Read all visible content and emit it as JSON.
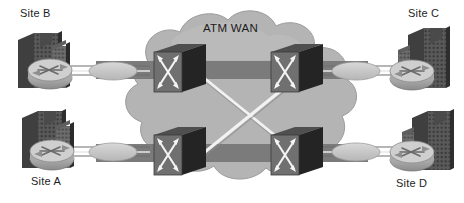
{
  "diagram": {
    "title": "ATM WAN",
    "type": "network-topology",
    "canvas": {
      "width": 464,
      "height": 203
    },
    "background_color": "#ffffff"
  },
  "cloud": {
    "label": "ATM WAN",
    "fill_color": "#b4b4b4",
    "edge_color": "#9a9a9a",
    "band_color": "#7b7b7b"
  },
  "sites": [
    {
      "id": "site-b",
      "label": "Site B",
      "position": "top-left",
      "device": "router",
      "building": "office-building"
    },
    {
      "id": "site-c",
      "label": "Site C",
      "position": "top-right",
      "device": "router",
      "building": "office-building"
    },
    {
      "id": "site-a",
      "label": "Site A",
      "position": "bottom-left",
      "device": "router",
      "building": "office-building"
    },
    {
      "id": "site-d",
      "label": "Site D",
      "position": "bottom-right",
      "device": "router",
      "building": "office-building"
    }
  ],
  "switches": [
    {
      "id": "atm-switch-top-left",
      "type": "atm-switch",
      "x": 175,
      "y": 68
    },
    {
      "id": "atm-switch-top-right",
      "type": "atm-switch",
      "x": 292,
      "y": 68
    },
    {
      "id": "atm-switch-bottom-left",
      "type": "atm-switch",
      "x": 175,
      "y": 151
    },
    {
      "id": "atm-switch-bottom-right",
      "type": "atm-switch",
      "x": 292,
      "y": 151
    }
  ],
  "links": [
    {
      "id": "link-top-horizontal",
      "from": "atm-switch-top-left",
      "to": "atm-switch-top-right",
      "style": "trunk-band"
    },
    {
      "id": "link-bottom-horizontal",
      "from": "atm-switch-bottom-left",
      "to": "atm-switch-bottom-right",
      "style": "trunk-band"
    },
    {
      "id": "link-diagonal-a",
      "from": "atm-switch-top-left",
      "to": "atm-switch-bottom-right",
      "style": "white-line"
    },
    {
      "id": "link-diagonal-b",
      "from": "atm-switch-top-right",
      "to": "atm-switch-bottom-left",
      "style": "white-line"
    },
    {
      "id": "link-site-b",
      "from": "site-b",
      "to": "atm-switch-top-left",
      "style": "access-circuit"
    },
    {
      "id": "link-site-a",
      "from": "site-a",
      "to": "atm-switch-bottom-left",
      "style": "access-circuit"
    },
    {
      "id": "link-site-c",
      "from": "site-c",
      "to": "atm-switch-top-right",
      "style": "access-circuit"
    },
    {
      "id": "link-site-d",
      "from": "site-d",
      "to": "atm-switch-bottom-right",
      "style": "access-circuit"
    }
  ],
  "colors": {
    "cloud_fill": "#b4b4b4",
    "cloud_band": "#7b7b7b",
    "switch_face": "#6e6e6e",
    "switch_side": "#2b2b2b",
    "switch_top": "#4a4a4a",
    "router_body": "#a9a9a9",
    "building_dark": "#4d4d4d",
    "building_light": "#6b6b6b",
    "line_white": "#f2f2f2",
    "text": "#1d1d1d"
  }
}
